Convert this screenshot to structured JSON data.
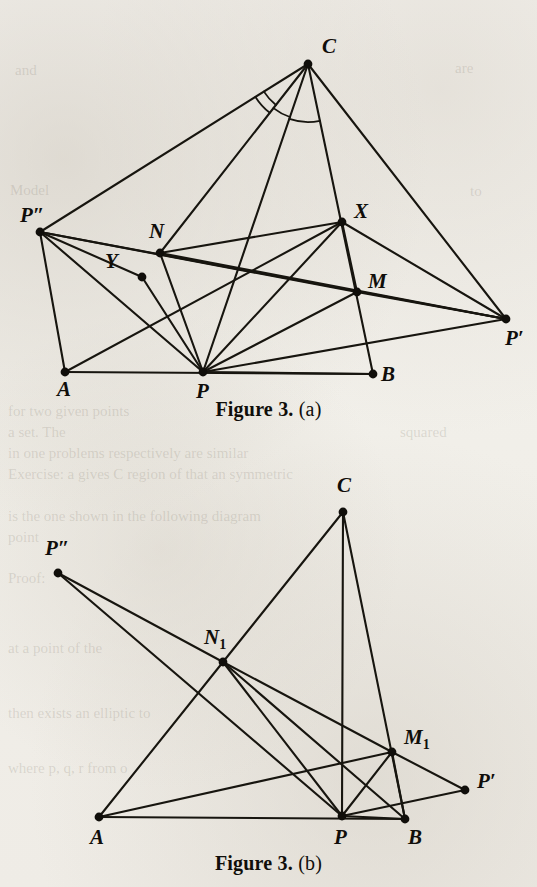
{
  "page": {
    "background_color": "#f1efe9",
    "ink_color": "#17150f"
  },
  "figures": [
    {
      "id": "figure-a",
      "caption_bold": "Figure 3.",
      "caption_plain": "(a)",
      "points": {
        "A": {
          "x": 65,
          "y": 372,
          "label": "A",
          "sub": "",
          "lx": 57,
          "ly": 396
        },
        "B": {
          "x": 373,
          "y": 374,
          "label": "B",
          "sub": "",
          "lx": 381,
          "ly": 381
        },
        "C": {
          "x": 308,
          "y": 64,
          "label": "C",
          "sub": "",
          "lx": 322,
          "ly": 53
        },
        "P": {
          "x": 203,
          "y": 372,
          "label": "P",
          "sub": "",
          "lx": 196,
          "ly": 398
        },
        "Pp": {
          "x": 506,
          "y": 319,
          "label": "P′",
          "sub": "",
          "lx": 505,
          "ly": 345
        },
        "Ppp": {
          "x": 40,
          "y": 232,
          "label": "P″",
          "sub": "",
          "lx": 20,
          "ly": 222
        },
        "N": {
          "x": 160,
          "y": 253,
          "label": "N",
          "sub": "",
          "lx": 149,
          "ly": 238
        },
        "M": {
          "x": 357,
          "y": 292,
          "label": "M",
          "sub": "",
          "lx": 368,
          "ly": 288
        },
        "X": {
          "x": 342,
          "y": 222,
          "label": "X",
          "sub": "",
          "lx": 354,
          "ly": 218
        },
        "Y": {
          "x": 142,
          "y": 277,
          "label": "Y",
          "sub": "",
          "lx": 105,
          "ly": 268
        }
      },
      "edges": [
        [
          "A",
          "B"
        ],
        [
          "A",
          "Ppp"
        ],
        [
          "A",
          "X"
        ],
        [
          "C",
          "Ppp"
        ],
        [
          "C",
          "N"
        ],
        [
          "C",
          "P"
        ],
        [
          "C",
          "B"
        ],
        [
          "C",
          "Pp"
        ],
        [
          "P",
          "Ppp"
        ],
        [
          "P",
          "N"
        ],
        [
          "P",
          "Y"
        ],
        [
          "P",
          "X"
        ],
        [
          "P",
          "M"
        ],
        [
          "P",
          "Pp"
        ],
        [
          "P",
          "B"
        ],
        [
          "Ppp",
          "Y"
        ],
        [
          "Ppp",
          "M"
        ],
        [
          "Ppp",
          "Pp"
        ],
        [
          "N",
          "X"
        ],
        [
          "N",
          "Pp"
        ],
        [
          "X",
          "M"
        ],
        [
          "X",
          "Pp"
        ],
        [
          "M",
          "Pp"
        ]
      ],
      "angle_arcs": [
        {
          "at": "C",
          "from": "Ppp",
          "to": "N",
          "radius": 52
        },
        {
          "at": "C",
          "from": "Ppp",
          "to": "N",
          "radius": 62
        },
        {
          "at": "C",
          "from": "N",
          "to": "P",
          "radius": 56
        },
        {
          "at": "C",
          "from": "P",
          "to": "B",
          "radius": 58
        }
      ]
    },
    {
      "id": "figure-b",
      "caption_bold": "Figure 3.",
      "caption_plain": "(b)",
      "points": {
        "A": {
          "x": 99,
          "y": 377,
          "label": "A",
          "sub": "",
          "lx": 90,
          "ly": 404
        },
        "B": {
          "x": 405,
          "y": 379,
          "label": "B",
          "sub": "",
          "lx": 408,
          "ly": 404
        },
        "C": {
          "x": 343,
          "y": 72,
          "label": "C",
          "sub": "",
          "lx": 337,
          "ly": 52
        },
        "P": {
          "x": 342,
          "y": 376,
          "label": "P",
          "sub": "",
          "lx": 334,
          "ly": 404
        },
        "Pp": {
          "x": 465,
          "y": 350,
          "label": "P′",
          "sub": "",
          "lx": 477,
          "ly": 348
        },
        "Ppp": {
          "x": 58,
          "y": 133,
          "label": "P″",
          "sub": "",
          "lx": 45,
          "ly": 115
        },
        "N1": {
          "x": 223,
          "y": 222,
          "label": "N",
          "sub": "1",
          "lx": 204,
          "ly": 204
        },
        "M1": {
          "x": 392,
          "y": 312,
          "label": "M",
          "sub": "1",
          "lx": 404,
          "ly": 304
        }
      },
      "edges": [
        [
          "A",
          "B"
        ],
        [
          "A",
          "N1"
        ],
        [
          "A",
          "M1"
        ],
        [
          "C",
          "N1"
        ],
        [
          "C",
          "P"
        ],
        [
          "C",
          "B"
        ],
        [
          "Ppp",
          "N1"
        ],
        [
          "Ppp",
          "P"
        ],
        [
          "N1",
          "P"
        ],
        [
          "N1",
          "M1"
        ],
        [
          "N1",
          "B"
        ],
        [
          "M1",
          "P"
        ],
        [
          "M1",
          "B"
        ],
        [
          "M1",
          "Pp"
        ],
        [
          "P",
          "Pp"
        ],
        [
          "P",
          "B"
        ]
      ],
      "angle_arcs": []
    }
  ],
  "ghost_text": [
    {
      "text": "are",
      "x": 455,
      "y": 60
    },
    {
      "text": "and",
      "x": 15,
      "y": 62
    },
    {
      "text": "Model",
      "x": 10,
      "y": 182
    },
    {
      "text": "to",
      "x": 470,
      "y": 183
    },
    {
      "text": "for two given points",
      "x": 8,
      "y": 403
    },
    {
      "text": "a set. The",
      "x": 8,
      "y": 424
    },
    {
      "text": "squared",
      "x": 400,
      "y": 424
    },
    {
      "text": "in one problems respectively are similar",
      "x": 8,
      "y": 445
    },
    {
      "text": "Exercise: a gives C region of that an symmetric",
      "x": 8,
      "y": 466
    },
    {
      "text": "is the one shown in the following diagram",
      "x": 8,
      "y": 508
    },
    {
      "text": "point",
      "x": 8,
      "y": 529
    },
    {
      "text": "Proof:",
      "x": 8,
      "y": 570
    },
    {
      "text": "at a point of the",
      "x": 8,
      "y": 640
    },
    {
      "text": "then exists an elliptic to",
      "x": 8,
      "y": 705
    },
    {
      "text": "where p, q, r from o",
      "x": 8,
      "y": 760
    }
  ]
}
